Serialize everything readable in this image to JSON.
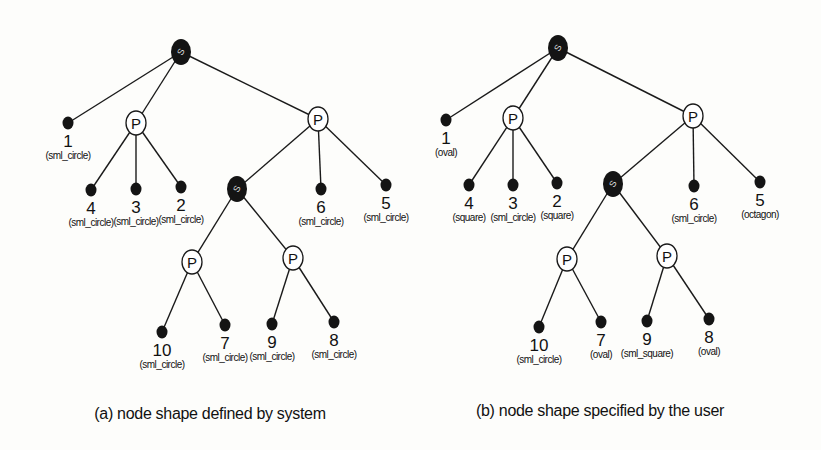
{
  "diagrams": [
    {
      "id": "a",
      "caption": "(a) node shape defined by system",
      "caption_pos": [
        210,
        405
      ],
      "nodes": [
        {
          "id": "rootS",
          "type": "S",
          "x": 181,
          "y": 52
        },
        {
          "id": "n1",
          "type": "leaf",
          "x": 68,
          "y": 123,
          "num": "1",
          "shape": "(sml_circle)"
        },
        {
          "id": "P1",
          "type": "P",
          "x": 136,
          "y": 123
        },
        {
          "id": "P2",
          "type": "P",
          "x": 318,
          "y": 119
        },
        {
          "id": "n4",
          "type": "leaf",
          "x": 91,
          "y": 190,
          "num": "4",
          "shape": "(sml_circle)"
        },
        {
          "id": "n3",
          "type": "leaf",
          "x": 136,
          "y": 189,
          "num": "3",
          "shape": "(sml_circle)"
        },
        {
          "id": "n2",
          "type": "leaf",
          "x": 181,
          "y": 187,
          "num": "2",
          "shape": "(sml_circle)"
        },
        {
          "id": "S2",
          "type": "S",
          "x": 237,
          "y": 189
        },
        {
          "id": "n6",
          "type": "leaf",
          "x": 321,
          "y": 189,
          "num": "6",
          "shape": "(sml_circle)"
        },
        {
          "id": "n5",
          "type": "leaf",
          "x": 386,
          "y": 185,
          "num": "5",
          "shape": "(sml_circle)"
        },
        {
          "id": "P3",
          "type": "P",
          "x": 192,
          "y": 262
        },
        {
          "id": "P4",
          "type": "P",
          "x": 293,
          "y": 258
        },
        {
          "id": "n10",
          "type": "leaf",
          "x": 162,
          "y": 332,
          "num": "10",
          "shape": "(sml_circle)"
        },
        {
          "id": "n7",
          "type": "leaf",
          "x": 225,
          "y": 325,
          "num": "7",
          "shape": "(sml_circle)"
        },
        {
          "id": "n9",
          "type": "leaf",
          "x": 272,
          "y": 324,
          "num": "9",
          "shape": "(sml_circle)"
        },
        {
          "id": "n8",
          "type": "leaf",
          "x": 334,
          "y": 322,
          "num": "8",
          "shape": "(sml_circle)"
        }
      ],
      "edges": [
        [
          "rootS",
          "n1"
        ],
        [
          "rootS",
          "P1"
        ],
        [
          "rootS",
          "P2"
        ],
        [
          "P1",
          "n4"
        ],
        [
          "P1",
          "n3"
        ],
        [
          "P1",
          "n2"
        ],
        [
          "P2",
          "S2"
        ],
        [
          "P2",
          "n6"
        ],
        [
          "P2",
          "n5"
        ],
        [
          "S2",
          "P3"
        ],
        [
          "S2",
          "P4"
        ],
        [
          "P3",
          "n10"
        ],
        [
          "P3",
          "n7"
        ],
        [
          "P4",
          "n9"
        ],
        [
          "P4",
          "n8"
        ]
      ]
    },
    {
      "id": "b",
      "caption": "(b) node shape specified by the user",
      "caption_pos": [
        600,
        402
      ],
      "nodes": [
        {
          "id": "rootS",
          "type": "S",
          "x": 558,
          "y": 48
        },
        {
          "id": "n1",
          "type": "leaf",
          "x": 446,
          "y": 120,
          "num": "1",
          "shape": "(oval)"
        },
        {
          "id": "P1",
          "type": "P",
          "x": 513,
          "y": 118
        },
        {
          "id": "P2",
          "type": "P",
          "x": 693,
          "y": 116
        },
        {
          "id": "n4",
          "type": "leaf",
          "x": 469,
          "y": 185,
          "num": "4",
          "shape": "(square)"
        },
        {
          "id": "n3",
          "type": "leaf",
          "x": 513,
          "y": 185,
          "num": "3",
          "shape": "(sml_circle)"
        },
        {
          "id": "n2",
          "type": "leaf",
          "x": 557,
          "y": 183,
          "num": "2",
          "shape": "(square)"
        },
        {
          "id": "S2",
          "type": "S",
          "x": 613,
          "y": 184
        },
        {
          "id": "n6",
          "type": "leaf",
          "x": 694,
          "y": 186,
          "num": "6",
          "shape": "(sml_circle)"
        },
        {
          "id": "n5",
          "type": "leaf",
          "x": 760,
          "y": 182,
          "num": "5",
          "shape": "(octagon)"
        },
        {
          "id": "P3",
          "type": "P",
          "x": 567,
          "y": 259
        },
        {
          "id": "P4",
          "type": "P",
          "x": 667,
          "y": 256
        },
        {
          "id": "n10",
          "type": "leaf",
          "x": 539,
          "y": 327,
          "num": "10",
          "shape": "(sml_circle)"
        },
        {
          "id": "n7",
          "type": "leaf",
          "x": 601,
          "y": 322,
          "num": "7",
          "shape": "(oval)"
        },
        {
          "id": "n9",
          "type": "leaf",
          "x": 647,
          "y": 321,
          "num": "9",
          "shape": "(sml_square)"
        },
        {
          "id": "n8",
          "type": "leaf",
          "x": 709,
          "y": 319,
          "num": "8",
          "shape": "(oval)"
        }
      ],
      "edges": [
        [
          "rootS",
          "n1"
        ],
        [
          "rootS",
          "P1"
        ],
        [
          "rootS",
          "P2"
        ],
        [
          "P1",
          "n4"
        ],
        [
          "P1",
          "n3"
        ],
        [
          "P1",
          "n2"
        ],
        [
          "P2",
          "S2"
        ],
        [
          "P2",
          "n6"
        ],
        [
          "P2",
          "n5"
        ],
        [
          "S2",
          "P3"
        ],
        [
          "S2",
          "P4"
        ],
        [
          "P3",
          "n10"
        ],
        [
          "P3",
          "n7"
        ],
        [
          "P4",
          "n9"
        ],
        [
          "P4",
          "n8"
        ]
      ]
    }
  ],
  "labels": {
    "P": "P",
    "S": "S"
  },
  "colors": {
    "ink": "#141414",
    "background": "#fdfdfb"
  }
}
